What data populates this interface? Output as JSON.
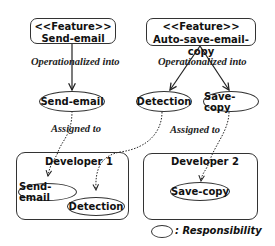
{
  "features": [
    {
      "stereotype": "<<Feature>>",
      "name": "Send-email"
    },
    {
      "stereotype": "<<Feature>>",
      "name": "Auto-save-email-copy"
    }
  ],
  "edge_labels": {
    "operationalized_left": "Operationalized into",
    "operationalized_right": "Operationalized into",
    "assigned_left": "Assigned to",
    "assigned_right": "Assigned to"
  },
  "responsibilities": [
    "Send-email",
    "Detection",
    "Save-copy"
  ],
  "developers": [
    {
      "name": "Developer 1",
      "responsibilities": [
        "Send-email",
        "Detection"
      ]
    },
    {
      "name": "Developer 2",
      "responsibilities": [
        "Save-copy"
      ]
    }
  ],
  "legend": {
    "label": ": Responsibility"
  }
}
